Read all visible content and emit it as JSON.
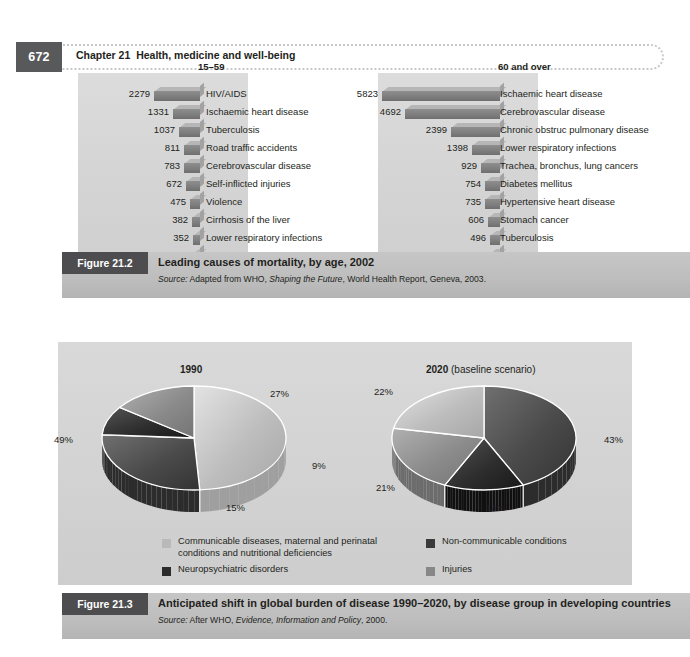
{
  "header": {
    "folio": "672",
    "chapter": "Chapter 21",
    "chapter_title": "Health, medicine and well-being"
  },
  "figure_21_2": {
    "tag": "Figure 21.2",
    "title": "Leading causes of mortality, by age, 2002",
    "source_label": "Source:",
    "source_text_a": " Adapted from WHO, ",
    "source_italic": "Shaping the Future",
    "source_text_b": ", World Health Report, Geneva, 2003."
  },
  "figure_21_3": {
    "tag": "Figure 21.3",
    "title": "Anticipated shift in global burden of disease 1990–2020, by disease group in developing countries",
    "source_label": "Source:",
    "source_text_a": " After WHO, ",
    "source_italic": "Evidence, Information and Policy",
    "source_text_b": ", 2000."
  },
  "legend": {
    "items": [
      {
        "label": "Communicable diseases, maternal and perinatal conditions and nutritional deficiencies",
        "color": "#b9b9b9"
      },
      {
        "label": "Non-communicable conditions",
        "color": "#3a3a3a"
      },
      {
        "label": "Neuropsychiatric disorders",
        "color": "#2c2c2c"
      },
      {
        "label": "Injuries",
        "color": "#878787"
      }
    ]
  },
  "chart_data": [
    {
      "type": "bar",
      "title": "15–59",
      "orientation": "horizontal",
      "xlabel": "",
      "ylabel": "",
      "value_unit": "thousands of deaths",
      "categories": [
        "HIV/AIDS",
        "Ischaemic  heart disease",
        "Tuberculosis",
        "Road traffic accidents",
        "Cerebrovascular disease",
        "Self-inflicted injuries",
        "Violence",
        "Cirrhosis of the liver",
        " Lower respiratory infections",
        "Chronic obstruc pulmonary disease"
      ],
      "values": [
        2279,
        1331,
        1037,
        811,
        783,
        672,
        475,
        382,
        352,
        343
      ],
      "xlim": [
        0,
        5823
      ]
    },
    {
      "type": "bar",
      "title": "60 and over",
      "orientation": "horizontal",
      "xlabel": "",
      "ylabel": "",
      "value_unit": "thousands of deaths",
      "categories": [
        "Ischaemic heart disease",
        "Cerebrovascular disease",
        "Chronic obstruc pulmonary disease",
        "Lower respiratory infections",
        "Trachea, bronchus, lung cancers",
        "Diabetes mellitus",
        "Hypertensive heart disease",
        "Stomach cancer",
        " Tuberculosis",
        "Colon and rectal cancers"
      ],
      "values": [
        5823,
        4692,
        2399,
        1398,
        929,
        754,
        735,
        606,
        496,
        478
      ],
      "xlim": [
        0,
        5823
      ]
    },
    {
      "type": "pie",
      "title": "1990",
      "subtitle": "",
      "labels": [
        "Communicable diseases, maternal and perinatal conditions and nutritional deficiencies",
        "Non-communicable conditions",
        "Neuropsychiatric disorders",
        "Injuries"
      ],
      "values": [
        49,
        27,
        9,
        15
      ],
      "display_labels": [
        "49%",
        "27%",
        "9%",
        "15%"
      ],
      "colors": [
        "#bdbdbd",
        "#4a4a4a",
        "#2e2e2e",
        "#8a8a8a"
      ]
    },
    {
      "type": "pie",
      "title": "2020",
      "subtitle": "(baseline scenario)",
      "labels": [
        "Non-communicable conditions",
        "Neuropsychiatric disorders",
        "Injuries",
        "Communicable diseases, maternal and perinatal conditions and nutritional deficiencies"
      ],
      "values": [
        43,
        14,
        21,
        22
      ],
      "display_labels": [
        "43%",
        "14%",
        "21%",
        "22%"
      ],
      "colors": [
        "#4a4a4a",
        "#2e2e2e",
        "#8a8a8a",
        "#bdbdbd"
      ]
    }
  ]
}
